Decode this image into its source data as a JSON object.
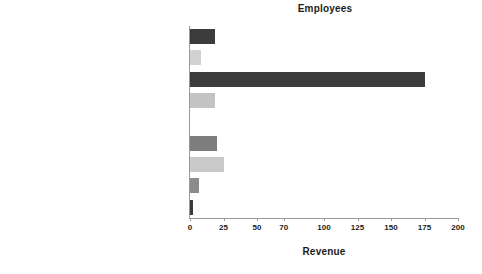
{
  "chart_data": {
    "type": "bar",
    "orientation": "horizontal",
    "title": "Employees",
    "xlabel": "Revenue",
    "ylabel": "",
    "xlim": [
      0,
      200
    ],
    "xticks": [
      0,
      25,
      50,
      70,
      100,
      125,
      150,
      175,
      200
    ],
    "xtick_labels": [
      "0",
      "25",
      "50",
      "70",
      "100",
      "125",
      "150",
      "175",
      "200"
    ],
    "grid": false,
    "legend": "none",
    "categories": [
      "Wholesale Trade",
      "Transportation and Utility",
      "Services",
      "Retail Trade",
      "Not Assigned",
      "Manufacturing",
      "Finance, Insurance and Real Estate",
      "Construction",
      "Agriculture, Forestry and Fishing"
    ],
    "values": [
      19,
      8,
      175,
      19,
      0,
      20,
      25,
      7,
      2
    ],
    "bar_colors": [
      "#3b3b3b",
      "#d2d2d2",
      "#3b3b3b",
      "#c3c3c3",
      "#8c8c8c",
      "#7d7d7d",
      "#c9c9c9",
      "#8c8c8c",
      "#3b3b3b"
    ]
  },
  "axis": {
    "line_color": "#9a9a9a"
  }
}
